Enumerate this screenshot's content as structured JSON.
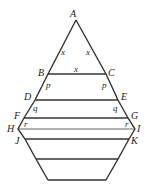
{
  "diagram": {
    "points": [
      {
        "name": "A",
        "x": 76,
        "y": 20
      },
      {
        "name": "B",
        "x": 48,
        "y": 74
      },
      {
        "name": "C",
        "x": 106,
        "y": 74
      },
      {
        "name": "D",
        "x": 35,
        "y": 100
      },
      {
        "name": "E",
        "x": 118,
        "y": 100
      },
      {
        "name": "F",
        "x": 24,
        "y": 118
      },
      {
        "name": "G",
        "x": 128,
        "y": 118
      },
      {
        "name": "H",
        "x": 18,
        "y": 129
      },
      {
        "name": "I",
        "x": 135,
        "y": 129
      },
      {
        "name": "J",
        "x": 25,
        "y": 139
      },
      {
        "name": "K",
        "x": 129,
        "y": 139
      }
    ],
    "labels": {
      "A": "A",
      "B": "B",
      "C": "C",
      "D": "D",
      "E": "E",
      "F": "F",
      "G": "G",
      "H": "H",
      "I": "I",
      "J": "J",
      "K": "K"
    },
    "segment_labels": {
      "AB": "x",
      "AC": "x",
      "BC": "x",
      "BD": "p",
      "CE": "p",
      "DF": "q",
      "EG": "q",
      "FH": "r",
      "GI": "r"
    }
  }
}
